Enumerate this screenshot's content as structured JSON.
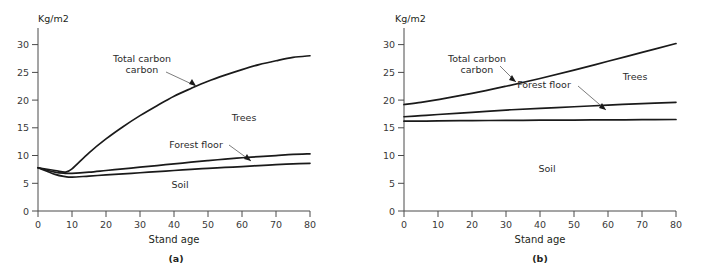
{
  "figure": {
    "name": "carbon-accumulation-by-stand-age",
    "panel_captions": [
      "(a)",
      "(b)"
    ]
  },
  "chart_data": [
    {
      "type": "line",
      "panel": "(a)",
      "title": "",
      "xlabel": "Stand age",
      "ylabel": "",
      "yunit": "Kg/m2",
      "xlim": [
        0,
        80
      ],
      "ylim": [
        0,
        33
      ],
      "xticks": [
        0,
        10,
        20,
        30,
        40,
        50,
        60,
        70,
        80
      ],
      "xtick_labels": [
        "0",
        "10",
        "20",
        "30",
        "40",
        "50",
        "60",
        "70",
        "80"
      ],
      "yticks": [
        0,
        5,
        10,
        15,
        20,
        25,
        30
      ],
      "ytick_labels": [
        "0",
        "5",
        "10",
        "15",
        "20",
        "25",
        "30"
      ],
      "grid": false,
      "legend_position": "inline-annotations",
      "x": [
        0,
        5,
        8,
        10,
        15,
        20,
        25,
        30,
        35,
        40,
        45,
        50,
        55,
        60,
        65,
        70,
        75,
        80
      ],
      "series": [
        {
          "name": "Total carbon",
          "values": [
            7.8,
            7.3,
            7.0,
            7.6,
            10.5,
            13.0,
            15.2,
            17.2,
            19.0,
            20.7,
            22.1,
            23.4,
            24.5,
            25.5,
            26.4,
            27.1,
            27.7,
            28.0
          ]
        },
        {
          "name": "Forest floor",
          "values": [
            7.8,
            7.0,
            6.8,
            6.8,
            7.0,
            7.3,
            7.6,
            7.9,
            8.2,
            8.5,
            8.8,
            9.1,
            9.35,
            9.6,
            9.8,
            10.0,
            10.2,
            10.3
          ]
        },
        {
          "name": "Soil",
          "values": [
            7.8,
            6.6,
            6.2,
            6.1,
            6.3,
            6.5,
            6.7,
            6.9,
            7.1,
            7.3,
            7.5,
            7.7,
            7.85,
            8.0,
            8.2,
            8.35,
            8.5,
            8.6
          ]
        }
      ],
      "annotations": [
        {
          "label": "Total carbon",
          "points_to_series": "Total carbon"
        },
        {
          "label": "Forest floor",
          "points_to_series": "Forest floor"
        },
        {
          "label": "Trees",
          "points_to_series": "Trees region"
        },
        {
          "label": "Soil",
          "points_to_series": "Soil region"
        }
      ]
    },
    {
      "type": "line",
      "panel": "(b)",
      "title": "",
      "xlabel": "Stand age",
      "ylabel": "",
      "yunit": "Kg/m2",
      "xlim": [
        0,
        80
      ],
      "ylim": [
        0,
        33
      ],
      "xticks": [
        0,
        10,
        20,
        30,
        40,
        50,
        60,
        70,
        80
      ],
      "xtick_labels": [
        "0",
        "10",
        "20",
        "30",
        "40",
        "50",
        "60",
        "70",
        "80"
      ],
      "yticks": [
        0,
        5,
        10,
        15,
        20,
        25,
        30
      ],
      "ytick_labels": [
        "0",
        "5",
        "10",
        "15",
        "20",
        "25",
        "30"
      ],
      "grid": false,
      "legend_position": "inline-annotations",
      "x": [
        0,
        5,
        10,
        20,
        30,
        40,
        50,
        60,
        70,
        80
      ],
      "series": [
        {
          "name": "Total carbon",
          "values": [
            19.2,
            19.6,
            20.1,
            21.2,
            22.5,
            23.9,
            25.4,
            27.0,
            28.6,
            30.2
          ]
        },
        {
          "name": "Forest floor",
          "values": [
            17.0,
            17.2,
            17.4,
            17.8,
            18.2,
            18.5,
            18.8,
            19.1,
            19.35,
            19.6
          ]
        },
        {
          "name": "Soil",
          "values": [
            16.2,
            16.2,
            16.25,
            16.3,
            16.33,
            16.37,
            16.4,
            16.43,
            16.47,
            16.5
          ]
        }
      ],
      "annotations": [
        {
          "label": "Total carbon",
          "points_to_series": "Total carbon"
        },
        {
          "label": "Forest floor",
          "points_to_series": "Forest floor"
        },
        {
          "label": "Trees",
          "points_to_series": "Trees region"
        },
        {
          "label": "Soil",
          "points_to_series": "Soil region"
        }
      ]
    }
  ]
}
